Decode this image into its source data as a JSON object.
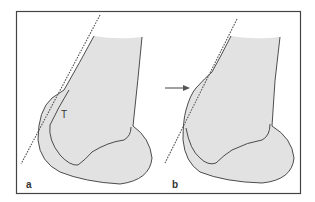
{
  "figure": {
    "panels": [
      {
        "id": "a",
        "label": "a",
        "annotation": "T",
        "has_arrow": false
      },
      {
        "id": "b",
        "label": "b",
        "annotation": "",
        "has_arrow": true
      }
    ],
    "colors": {
      "frame": "#444444",
      "bone_fill": "#e2e2e2",
      "outline": "#3a3a3a",
      "dashed_line": "#555555",
      "arrow": "#555555"
    }
  }
}
